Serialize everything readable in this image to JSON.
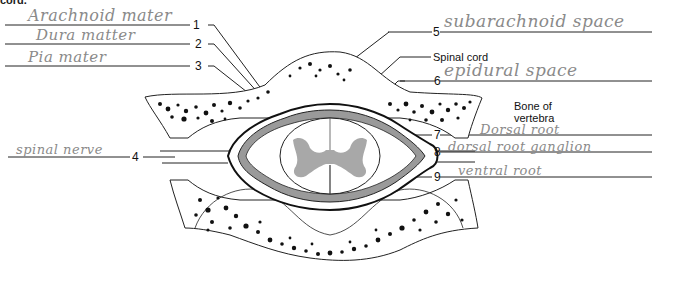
{
  "header": {
    "cut_text": "cord."
  },
  "diagram": {
    "printed_labels": {
      "spinal_cord": "Spinal cord",
      "bone_of_vertebra_line1": "Bone of",
      "bone_of_vertebra_line2": "vertebra"
    },
    "numbered_labels": [
      {
        "number": "1",
        "answer": "Arachnoid mater"
      },
      {
        "number": "2",
        "answer": "Dura matter"
      },
      {
        "number": "3",
        "answer": "Pia mater"
      },
      {
        "number": "4",
        "answer": "spinal nerve"
      },
      {
        "number": "5",
        "answer": "subarachnoid space"
      },
      {
        "number": "6",
        "answer": "epidural space"
      },
      {
        "number": "7",
        "answer": "Dorsal root"
      },
      {
        "number": "8",
        "answer": "dorsal root ganglion"
      },
      {
        "number": "9",
        "answer": "ventral root"
      }
    ],
    "colors": {
      "ink": "#111111",
      "handwriting": "#8a8a8a",
      "gray_matter": "#a8a8a8",
      "meninges": "#9a9a9a"
    }
  }
}
